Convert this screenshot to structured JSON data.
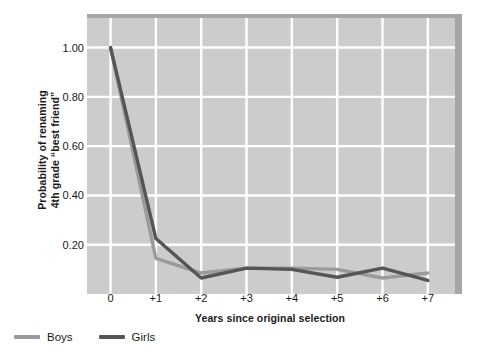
{
  "chart_data": {
    "type": "line",
    "title": "",
    "xlabel": "Years since original selection",
    "ylabel": "Probability of renaming 4th grade \"best friend\"",
    "ylabel_line1": "Probability of renaming",
    "ylabel_line2": "4th grade “best friend”",
    "categories": [
      "0",
      "+1",
      "+2",
      "+3",
      "+4",
      "+5",
      "+6",
      "+7"
    ],
    "x": [
      0,
      1,
      2,
      3,
      4,
      5,
      6,
      7
    ],
    "yticks": [
      "1.00",
      "0.80",
      "0.60",
      "0.40",
      "0.20"
    ],
    "ytick_values": [
      1.0,
      0.8,
      0.6,
      0.4,
      0.2
    ],
    "ylim": [
      0.0,
      1.12
    ],
    "xlim": [
      -0.52,
      7.6
    ],
    "grid": true,
    "legend_position": "below-left",
    "series": [
      {
        "name": "Boys",
        "color": "#9a9a9a",
        "values": [
          1.0,
          0.145,
          0.085,
          0.105,
          0.105,
          0.1,
          0.065,
          0.085
        ]
      },
      {
        "name": "Girls",
        "color": "#555555",
        "values": [
          1.0,
          0.225,
          0.065,
          0.105,
          0.1,
          0.068,
          0.105,
          0.055
        ]
      }
    ],
    "colors": {
      "plot_background": "#cccccc",
      "gridline": "#ffffff",
      "page_background": "#ffffff",
      "shadow_edge": "#a6a6a6",
      "text": "#1a1a1a"
    }
  }
}
